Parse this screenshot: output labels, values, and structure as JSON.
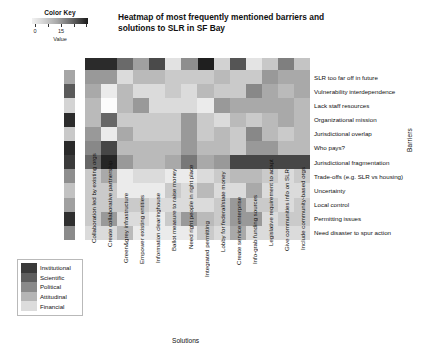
{
  "title": "Heatmap of most frequently mentioned barriers and solutions to SLR in SF Bay",
  "color_key": {
    "label": "Color Key",
    "axis_label": "Value",
    "ticks": [
      "0",
      "15"
    ],
    "tick_values": [
      0,
      15
    ],
    "gradient_low": "#f2f2f2",
    "gradient_high": "#1b1b1b"
  },
  "axes": {
    "rows_axis_label": "Barriers",
    "cols_axis_label": "Solutions"
  },
  "legend": {
    "items": [
      {
        "label": "Institutional",
        "color": "#3a3a3a"
      },
      {
        "label": "Scientific",
        "color": "#5e5e5e"
      },
      {
        "label": "Political",
        "color": "#8a8a8a"
      },
      {
        "label": "Attitudinal",
        "color": "#b5b5b5"
      },
      {
        "label": "Financial",
        "color": "#dcdcdc"
      }
    ]
  },
  "chart_data": {
    "type": "heatmap",
    "title": "Heatmap of most frequently mentioned barriers and solutions to SLR in SF Bay",
    "xlabel": "Solutions",
    "ylabel": "Barriers",
    "zlim": [
      0,
      15
    ],
    "colormap": "grayscale-reversed",
    "grid": false,
    "legend_position": "bottom-left",
    "rows": [
      "SLR too far off in future",
      "Vulnerability interdependence",
      "Lack staff resources",
      "Organizational mission",
      "Jurisdictional overlap",
      "Who pays?",
      "Jurisdictional fragmentation",
      "Trade-offs (e.g. SLR vs housing)",
      "Uncertainty",
      "Local control",
      "Permitting issues",
      "Need disaster to spur action"
    ],
    "columns": [
      "Collaboration led by existing orgs",
      "Create collaborative partnership",
      "Green&grey infrastructure",
      "Empower existing entities",
      "Information clearinghouse",
      "Ballot measure to raise money",
      "Need right people in right place",
      "Integrated permitting",
      "Lobby for federal/state money",
      "Create service enterprise",
      "Info-grab funding sources",
      "Legislative requirement to adapt",
      "Give communities info on SLR",
      "Include community-based orgs"
    ],
    "row_categories": [
      "Attitudinal",
      "Political",
      "Financial",
      "Institutional",
      "Institutional",
      "Financial",
      "Institutional",
      "Political",
      "Scientific",
      "Political",
      "Institutional",
      "Attitudinal"
    ],
    "column_categories": [
      "Institutional",
      "Institutional",
      "Attitudinal",
      "Political",
      "Financial",
      "Political",
      "Institutional",
      "Attitudinal",
      "Political",
      "Financial",
      "Attitudinal",
      "Political",
      "Attitudinal",
      "Financial"
    ],
    "row_annotation_colors": [
      "#a6a6a6",
      "#5a5a5a",
      "#d4d4d4",
      "#2c2c2c",
      "#c9c9c9",
      "#2a2a2a",
      "#3a3a3a",
      "#8e8e8e",
      "#c2c2c2",
      "#a0a0a0",
      "#2f2f2f",
      "#8b8b8b"
    ],
    "column_annotation_colors": [
      "#2b2b2b",
      "#2b2b2b",
      "#6a6a6a",
      "#a0a0a0",
      "#4a4a4a",
      "#e2e2e2",
      "#8e8e8e",
      "#1f1f1f",
      "#d2d2d2",
      "#555555",
      "#e4e4e4",
      "#c8c8c8",
      "#7f7f7f",
      "#c4c4c4"
    ],
    "values": [
      [
        6,
        6,
        2,
        4,
        4,
        3,
        3,
        3,
        4,
        3,
        3,
        6,
        5,
        5
      ],
      [
        5,
        1,
        4,
        2,
        2,
        3,
        2,
        4,
        3,
        3,
        7,
        5,
        4,
        5
      ],
      [
        4,
        0,
        4,
        6,
        2,
        2,
        2,
        1,
        6,
        5,
        5,
        5,
        5,
        4
      ],
      [
        4,
        9,
        3,
        3,
        3,
        3,
        6,
        3,
        2,
        4,
        3,
        4,
        5,
        4
      ],
      [
        6,
        1,
        5,
        3,
        3,
        3,
        6,
        3,
        4,
        3,
        7,
        4,
        3,
        4
      ],
      [
        7,
        11,
        4,
        4,
        4,
        4,
        6,
        4,
        4,
        3,
        6,
        6,
        4,
        4
      ],
      [
        9,
        13,
        6,
        4,
        4,
        5,
        8,
        5,
        6,
        11,
        11,
        11,
        11,
        11
      ],
      [
        3,
        5,
        1,
        2,
        2,
        1,
        1,
        2,
        3,
        4,
        4,
        3,
        2,
        3
      ],
      [
        3,
        3,
        1,
        1,
        1,
        3,
        2,
        4,
        2,
        2,
        5,
        2,
        2,
        2
      ],
      [
        3,
        3,
        3,
        3,
        2,
        2,
        2,
        2,
        3,
        6,
        3,
        3,
        2,
        3
      ],
      [
        3,
        6,
        2,
        2,
        1,
        3,
        6,
        4,
        3,
        6,
        6,
        2,
        3,
        3
      ],
      [
        2,
        2,
        4,
        1,
        1,
        1,
        1,
        3,
        2,
        5,
        2,
        2,
        2,
        2
      ]
    ]
  }
}
